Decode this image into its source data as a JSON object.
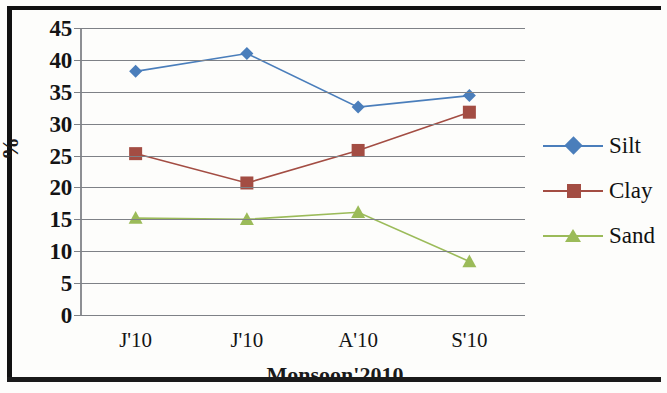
{
  "chart_data": {
    "type": "line",
    "title": "",
    "xlabel": "Monsoon'2010",
    "ylabel": "%",
    "categories": [
      "J'10",
      "J'10",
      "A'10",
      "S'10"
    ],
    "ylim": [
      0,
      45
    ],
    "ytick_step": 5,
    "yticks": [
      "45",
      "40",
      "35",
      "30",
      "25",
      "20",
      "15",
      "10",
      "5",
      "0"
    ],
    "grid": true,
    "legend_position": "right",
    "series": [
      {
        "name": "Silt",
        "color": "#4a7ebb",
        "marker": "diamond",
        "values": [
          38.2,
          41.0,
          32.6,
          34.4
        ]
      },
      {
        "name": "Clay",
        "color": "#a34d43",
        "marker": "square",
        "values": [
          25.3,
          20.7,
          25.8,
          31.8
        ]
      },
      {
        "name": "Sand",
        "color": "#9bbb59",
        "marker": "triangle",
        "values": [
          15.2,
          15.0,
          16.1,
          8.4
        ]
      }
    ]
  },
  "axis": {
    "y_title": "%",
    "x_title": "Monsoon'2010"
  },
  "legend": {
    "items": [
      {
        "label": "Silt"
      },
      {
        "label": "Clay"
      },
      {
        "label": "Sand"
      }
    ]
  }
}
